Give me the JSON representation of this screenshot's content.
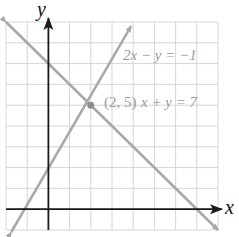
{
  "chart_data": {
    "type": "line",
    "title": "",
    "xlabel": "x",
    "ylabel": "y",
    "xlim": [
      -2,
      8
    ],
    "ylim": [
      -1,
      9
    ],
    "grid": true,
    "series": [
      {
        "name": "2x − y = −1",
        "equation": "y = 2x + 1",
        "x": [
          -1.75,
          3.9
        ],
        "y": [
          -2.5,
          8.8
        ],
        "color": "#a8a8a8"
      },
      {
        "name": "x + y = 7",
        "equation": "y = 7 − x",
        "x": [
          -2,
          8
        ],
        "y": [
          9,
          -1
        ],
        "color": "#a8a8a8"
      }
    ],
    "annotations": [
      {
        "text": "(2, 5)",
        "x": 2,
        "y": 5,
        "type": "intersection-point"
      }
    ]
  },
  "labels": {
    "x_axis": "x",
    "y_axis": "y",
    "eq1": "2x − y = −1",
    "eq2": "x + y = 7",
    "point": "(2, 5)"
  },
  "colors": {
    "grid": "#d6d6d6",
    "axis": "#1a1a1a",
    "line": "#a8a8a8",
    "text_gray": "#9a9a9a"
  }
}
